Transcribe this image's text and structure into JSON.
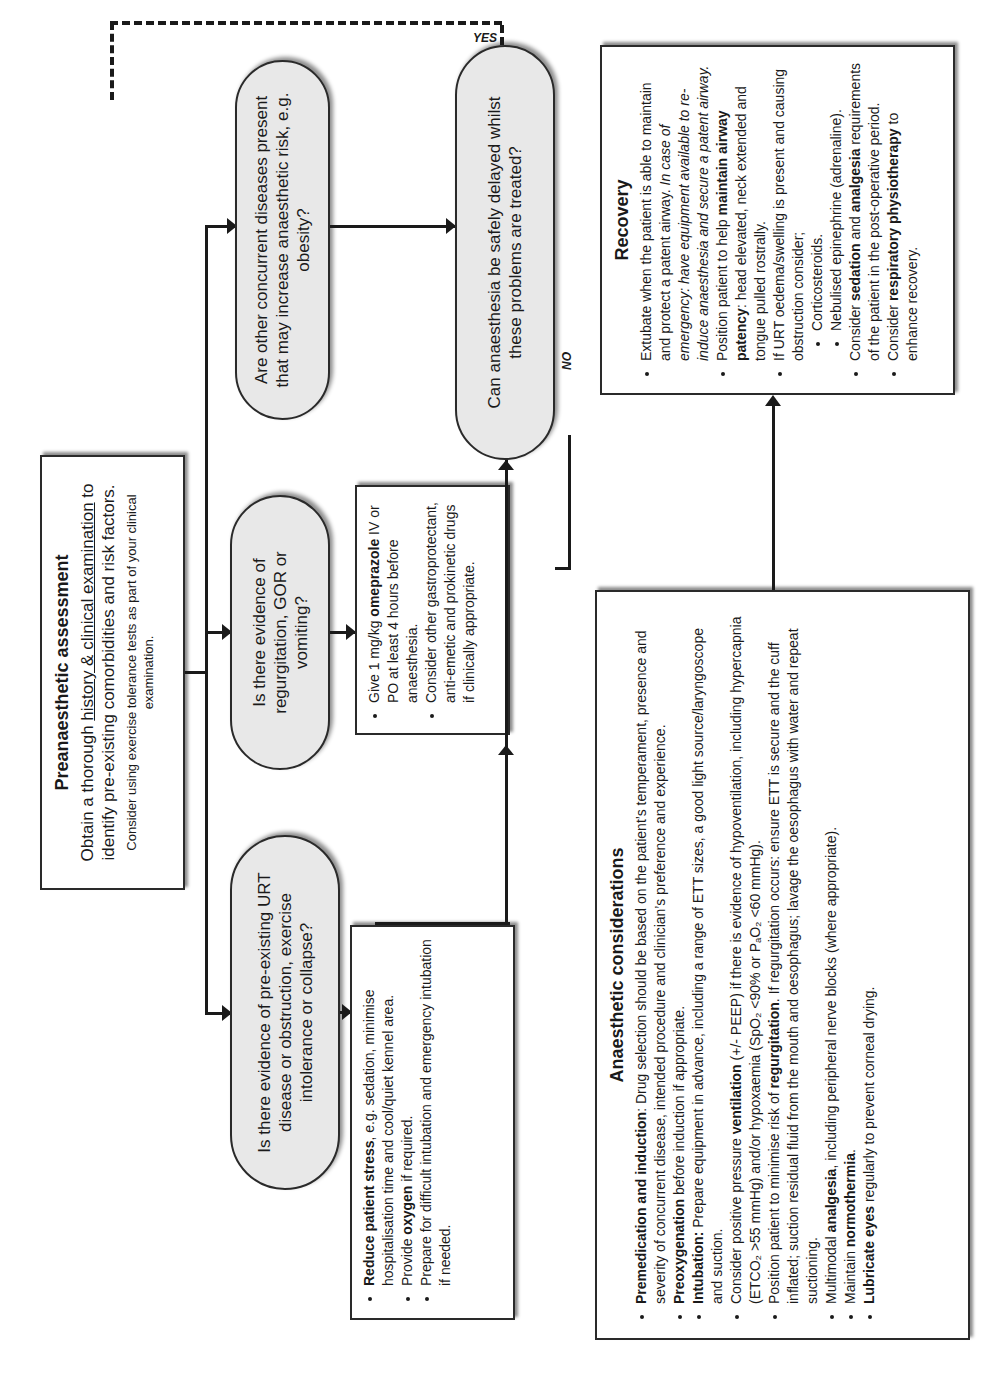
{
  "preassessment": {
    "title": "Preanaesthetic assessment",
    "line1_a": "Obtain a thorough ",
    "line1_u1": "history & clinical examination",
    "line1_b": " to identify pre-existing comorbidities and risk factors.",
    "note": "Consider using exercise tolerance tests as part of your clinical examination."
  },
  "questions": {
    "urt": "Is there evidence of pre-existing URT disease or obstruction, exercise intolerance or collapse?",
    "gor": "Is there evidence of regurgitation, GOR or vomiting?",
    "concurrent": "Are other concurrent diseases present that may increase anaesthetic risk, e.g. obesity?",
    "delay": "Can anaesthesia be safely delayed whilst these problems are treated?"
  },
  "labels": {
    "yes": "YES",
    "no": "NO"
  },
  "urt_actions": [
    {
      "bold": "Reduce patient stress",
      "text": ", e.g. sedation, minimise hospitalisation time and cool/quiet kennel area."
    },
    {
      "pre": "Provide ",
      "bold": "oxygen",
      "text": " if required."
    },
    {
      "pre": "Prepare for difficult intubation and emergency intubation if needed."
    }
  ],
  "gor_actions": [
    {
      "pre": "Give 1 mg/kg ",
      "bold": "omeprazole",
      "text": " IV or PO at least 4 hours before anaesthesia."
    },
    {
      "pre": "Consider other gastroprotectant, anti-emetic and prokinetic drugs if clinically appropriate."
    }
  ],
  "anaesthetic": {
    "title": "Anaesthetic considerations",
    "items": [
      {
        "bold": "Premedication and induction",
        "text": ": Drug selection should be based on the patient’s temperament, presence and severity of concurrent disease, intended procedure and clinician’s preference and experience."
      },
      {
        "bold": "Preoxygenation",
        "text": " before induction if appropriate."
      },
      {
        "bold": "Intubation:",
        "text": "  Prepare equipment in advance, including a range of ETT sizes, a good light source/laryngoscope and suction."
      },
      {
        "pre": "Consider positive pressure ",
        "bold": "ventilation",
        "text": " (+/- PEEP) if there is evidence of hypoventilation, including hypercapnia (ETCO₂ >55 mmHg) and/or hypoxaemia (SpO₂ <90% or PₐO₂ <60 mmHg)."
      },
      {
        "pre": "Position patient to minimise risk of ",
        "bold": "regurgitation",
        "text": ". If regurgitation occurs: ensure ETT is secure and the cuff inflated; suction residual fluid from the mouth and oesophagus; lavage the oesophagus with water and repeat suctioning."
      },
      {
        "pre": "Multimodal ",
        "bold": "analgesia",
        "text": ", including peripheral nerve blocks (where appropriate)."
      },
      {
        "pre": "Maintain ",
        "bold": "normothermia",
        "text": "."
      },
      {
        "bold": "Lubricate eyes",
        "text": " regularly to prevent corneal drying."
      }
    ]
  },
  "recovery": {
    "title": "Recovery",
    "item1_text": "Extubate when the patient is able to maintain and protect a patent airway.  ",
    "item1_italic": "In case of emergency: have equipment available to re-induce anaesthesia and secure a patent airway.",
    "item2_pre": "Position patient to help ",
    "item2_bold": "maintain airway patency",
    "item2_text": ": head elevated, neck extended and tongue pulled rostrally.",
    "item3_text": "If URT oedema/swelling is present and causing obstruction consider;",
    "sub_items": [
      "Corticosteroids.",
      "Nebulised epinephrine (adrenaline)."
    ],
    "item4_pre": "Consider ",
    "item4_bold1": "sedation",
    "item4_mid": " and ",
    "item4_bold2": "analgesia",
    "item4_text": " requirements of the patient in the post-operative period.",
    "item5_pre": "Consider ",
    "item5_bold": "respiratory physiotherapy",
    "item5_text": " to enhance recovery."
  }
}
